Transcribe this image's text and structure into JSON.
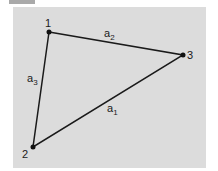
{
  "diagram": {
    "type": "triangle",
    "background_color": "#dcdcdc",
    "line_color": "#1a1a1a",
    "vertices": [
      {
        "id": "1",
        "label": "1",
        "x": 49,
        "y": 32
      },
      {
        "id": "2",
        "label": "2",
        "x": 33,
        "y": 147
      },
      {
        "id": "3",
        "label": "3",
        "x": 183,
        "y": 55
      }
    ],
    "edges": [
      {
        "from": "1",
        "to": "3",
        "label": "a",
        "subscript": "2"
      },
      {
        "from": "3",
        "to": "2",
        "label": "a",
        "subscript": "1"
      },
      {
        "from": "1",
        "to": "2",
        "label": "a",
        "subscript": "3"
      }
    ]
  }
}
